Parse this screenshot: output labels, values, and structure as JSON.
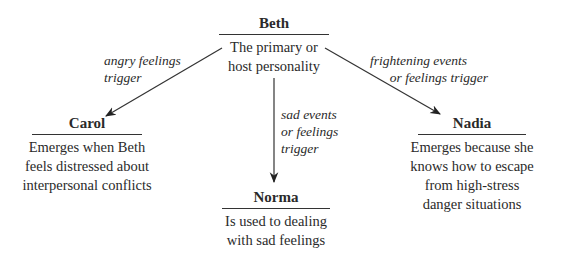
{
  "nodes": {
    "beth": {
      "name": "Beth",
      "desc_lines": [
        "The primary or",
        "host personality"
      ]
    },
    "carol": {
      "name": "Carol",
      "desc_lines": [
        "Emerges when Beth",
        "feels distressed about",
        "interpersonal conflicts"
      ]
    },
    "norma": {
      "name": "Norma",
      "desc_lines": [
        "Is used to dealing",
        "with sad feelings"
      ]
    },
    "nadia": {
      "name": "Nadia",
      "desc_lines": [
        "Emerges because she",
        "knows how to escape",
        "from high-stress",
        "danger situations"
      ]
    }
  },
  "edges": {
    "beth_to_carol": {
      "label_lines": [
        "angry feelings",
        "trigger"
      ]
    },
    "beth_to_norma": {
      "label_lines": [
        "sad events",
        "or feelings",
        "trigger"
      ]
    },
    "beth_to_nadia": {
      "label_lines": [
        "frightening events",
        "or feelings trigger"
      ]
    }
  },
  "colors": {
    "line": "#333333",
    "text": "#2a2a2a"
  }
}
